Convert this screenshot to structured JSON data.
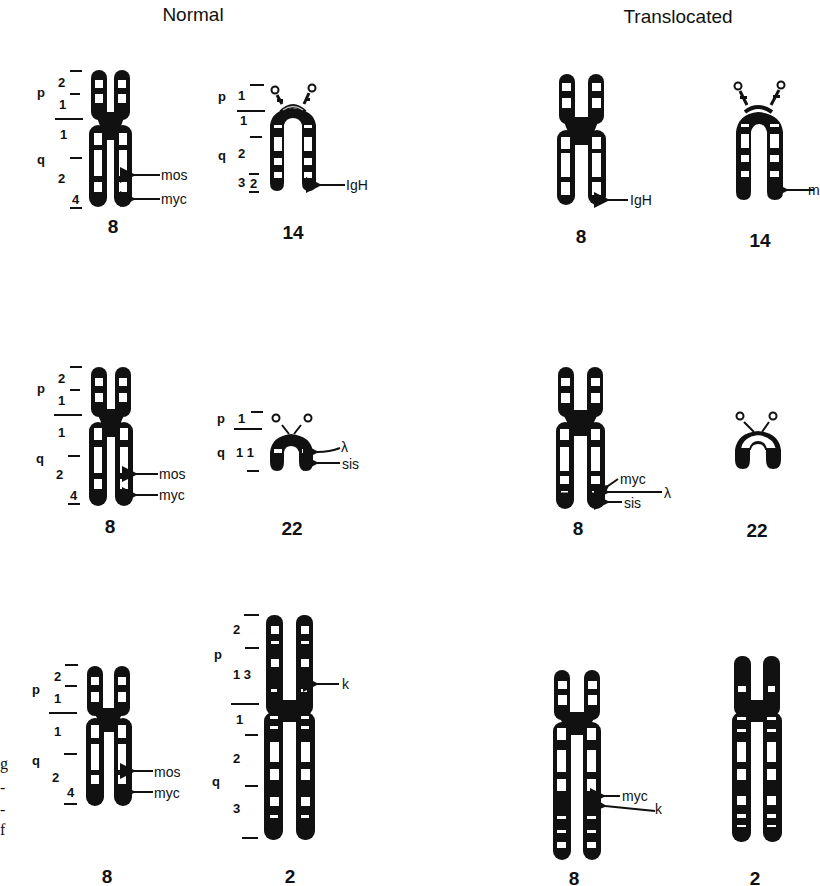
{
  "headers": {
    "normal": "Normal",
    "translocated": "Translocated"
  },
  "colors": {
    "ink": "#111111",
    "band_light": "#ffffff",
    "background": "#ffffff"
  },
  "rows": [
    {
      "normal": [
        {
          "chromosome": "8",
          "arm_labels": {
            "p": "p",
            "q": "q"
          },
          "bands": [
            "2",
            "1",
            "1",
            "2",
            "4"
          ],
          "genes": [
            "mos",
            "myc"
          ]
        },
        {
          "chromosome": "14",
          "arm_labels": {
            "p": "p",
            "q": "q"
          },
          "bands": [
            "1",
            "1",
            "2",
            "3",
            "2"
          ],
          "genes": [
            "IgH"
          ]
        }
      ],
      "translocated": [
        {
          "chromosome": "8",
          "genes": [
            "IgH"
          ]
        },
        {
          "chromosome": "14",
          "genes": [
            "m"
          ]
        }
      ]
    },
    {
      "normal": [
        {
          "chromosome": "8",
          "arm_labels": {
            "p": "p",
            "q": "q"
          },
          "bands": [
            "2",
            "1",
            "1",
            "2",
            "4"
          ],
          "genes": [
            "mos",
            "myc"
          ]
        },
        {
          "chromosome": "22",
          "arm_labels": {
            "p": "p",
            "q": "q"
          },
          "bands": [
            "1",
            "1 1"
          ],
          "genes": [
            "λ",
            "sis"
          ]
        }
      ],
      "translocated": [
        {
          "chromosome": "8",
          "genes": [
            "myc",
            "λ",
            "sis"
          ]
        },
        {
          "chromosome": "22",
          "genes": []
        }
      ]
    },
    {
      "normal": [
        {
          "chromosome": "8",
          "arm_labels": {
            "p": "p",
            "q": "q"
          },
          "bands": [
            "2",
            "1",
            "1",
            "2",
            "4"
          ],
          "genes": [
            "mos",
            "myc"
          ]
        },
        {
          "chromosome": "2",
          "arm_labels": {
            "p": "p",
            "q": "q"
          },
          "bands": [
            "2",
            "1 3",
            "1",
            "2",
            "3"
          ],
          "genes": [
            "k"
          ]
        }
      ],
      "translocated": [
        {
          "chromosome": "8",
          "genes": [
            "myc",
            "k"
          ]
        },
        {
          "chromosome": "2",
          "genes": []
        }
      ]
    }
  ],
  "edge_text": [
    "g",
    "-",
    "-",
    "f"
  ]
}
